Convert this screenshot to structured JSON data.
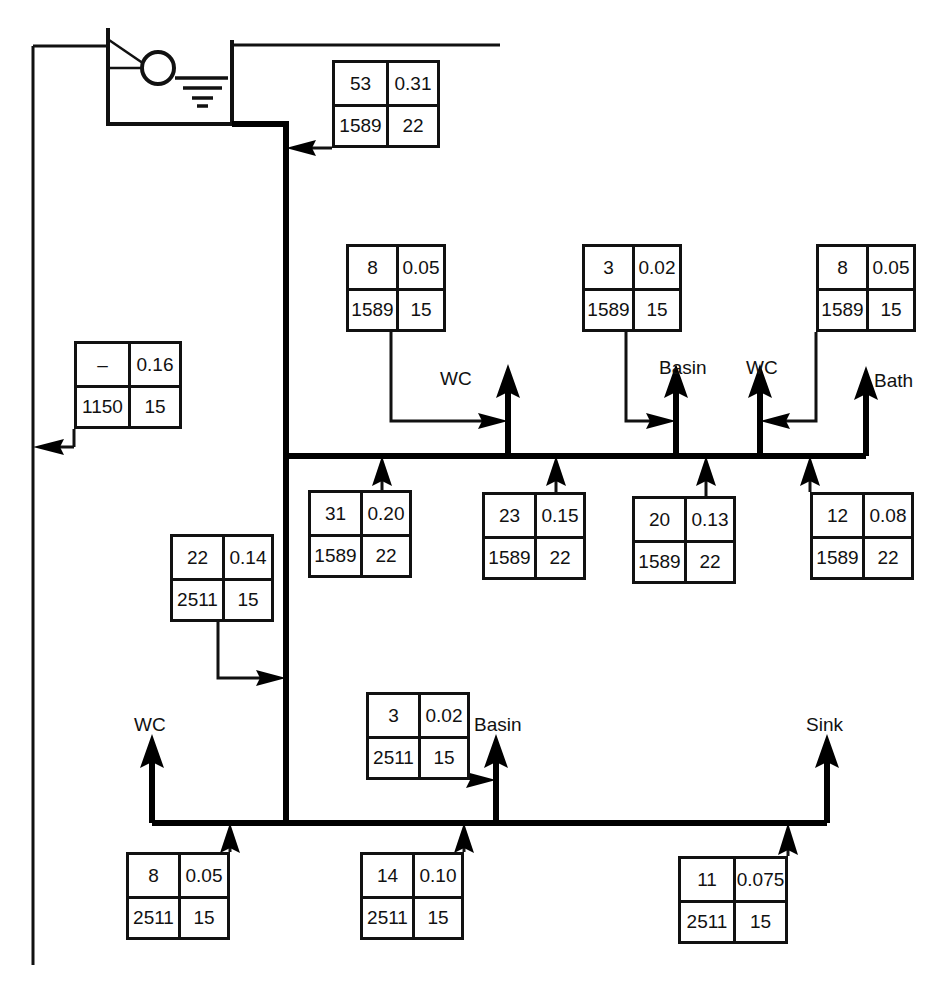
{
  "diagram": {
    "source_label": "cistern",
    "line_color": "#000000",
    "background": "#ffffff"
  },
  "boxes": [
    {
      "id": "box-cistern-feed",
      "name": "box-cistern-feed",
      "tl": "53",
      "tr": "0.31",
      "bl": "1589",
      "br": "22",
      "x": 332,
      "y": 60,
      "w": 108,
      "h": 88
    },
    {
      "id": "box-riser-left",
      "name": "box-riser-left",
      "tl": "–",
      "tr": "0.16",
      "bl": "1150",
      "br": "15",
      "x": 74,
      "y": 341,
      "w": 108,
      "h": 88
    },
    {
      "id": "box-wc-upper",
      "name": "box-wc-upper",
      "tl": "8",
      "tr": "0.05",
      "bl": "1589",
      "br": "15",
      "x": 346,
      "y": 244,
      "w": 100,
      "h": 88
    },
    {
      "id": "box-basin-upper",
      "name": "box-basin-upper",
      "tl": "3",
      "tr": "0.02",
      "bl": "1589",
      "br": "15",
      "x": 582,
      "y": 244,
      "w": 100,
      "h": 88
    },
    {
      "id": "box-bath-upper",
      "name": "box-bath-upper",
      "tl": "8",
      "tr": "0.05",
      "bl": "1589",
      "br": "15",
      "x": 816,
      "y": 244,
      "w": 100,
      "h": 88
    },
    {
      "id": "box-branch-22",
      "name": "box-branch-22",
      "tl": "22",
      "tr": "0.14",
      "bl": "2511",
      "br": "15",
      "x": 170,
      "y": 534,
      "w": 104,
      "h": 88
    },
    {
      "id": "box-branch-31",
      "name": "box-branch-31",
      "tl": "31",
      "tr": "0.20",
      "bl": "1589",
      "br": "22",
      "x": 308,
      "y": 490,
      "w": 104,
      "h": 88
    },
    {
      "id": "box-branch-23",
      "name": "box-branch-23",
      "tl": "23",
      "tr": "0.15",
      "bl": "1589",
      "br": "22",
      "x": 482,
      "y": 492,
      "w": 104,
      "h": 88
    },
    {
      "id": "box-branch-20",
      "name": "box-branch-20",
      "tl": "20",
      "tr": "0.13",
      "bl": "1589",
      "br": "22",
      "x": 632,
      "y": 496,
      "w": 104,
      "h": 88
    },
    {
      "id": "box-branch-12",
      "name": "box-branch-12",
      "tl": "12",
      "tr": "0.08",
      "bl": "1589",
      "br": "22",
      "x": 810,
      "y": 492,
      "w": 104,
      "h": 88
    },
    {
      "id": "box-basin-lower",
      "name": "box-basin-lower",
      "tl": "3",
      "tr": "0.02",
      "bl": "2511",
      "br": "15",
      "x": 366,
      "y": 692,
      "w": 104,
      "h": 88
    },
    {
      "id": "box-wc-lower",
      "name": "box-wc-lower",
      "tl": "8",
      "tr": "0.05",
      "bl": "2511",
      "br": "15",
      "x": 126,
      "y": 852,
      "w": 104,
      "h": 88
    },
    {
      "id": "box-mid-lower",
      "name": "box-mid-lower",
      "tl": "14",
      "tr": "0.10",
      "bl": "2511",
      "br": "15",
      "x": 360,
      "y": 852,
      "w": 104,
      "h": 88
    },
    {
      "id": "box-sink-lower",
      "name": "box-sink-lower",
      "tl": "11",
      "tr": "0.075",
      "bl": "2511",
      "br": "15",
      "x": 678,
      "y": 856,
      "w": 110,
      "h": 88
    }
  ],
  "fixtures": [
    {
      "id": "label-wc-upper",
      "name": "fixture-label-wc-upper",
      "text": "WC",
      "x": 440,
      "y": 368
    },
    {
      "id": "label-basin-upper",
      "name": "fixture-label-basin-upper",
      "text": "Basin",
      "x": 659,
      "y": 357
    },
    {
      "id": "label-wc-mid",
      "name": "fixture-label-wc-mid",
      "text": "WC",
      "x": 746,
      "y": 357
    },
    {
      "id": "label-bath",
      "name": "fixture-label-bath",
      "text": "Bath",
      "x": 874,
      "y": 370
    },
    {
      "id": "label-wc-lower",
      "name": "fixture-label-wc-lower",
      "text": "WC",
      "x": 134,
      "y": 714
    },
    {
      "id": "label-basin-lower",
      "name": "fixture-label-basin-lower",
      "text": "Basin",
      "x": 474,
      "y": 714
    },
    {
      "id": "label-sink",
      "name": "fixture-label-sink",
      "text": "Sink",
      "x": 806,
      "y": 714
    }
  ]
}
